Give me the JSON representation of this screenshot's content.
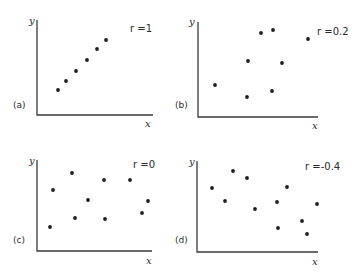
{
  "chart_data": [
    {
      "type": "scatter",
      "panel": "(a)",
      "annotation": "r = 1",
      "xlabel": "x",
      "ylabel": "y",
      "grid": false,
      "axis_box": {
        "x0": 37,
        "y0": 115,
        "x1": 153,
        "ytop": 20
      },
      "points": [
        [
          58,
          90
        ],
        [
          66,
          81
        ],
        [
          76,
          71
        ],
        [
          87,
          60
        ],
        [
          97,
          49
        ],
        [
          106,
          40
        ]
      ]
    },
    {
      "type": "scatter",
      "panel": "(b)",
      "annotation": "r = 0.2",
      "xlabel": "x",
      "ylabel": "y",
      "grid": false,
      "axis_box": {
        "x0": 198,
        "y0": 117,
        "x1": 318,
        "ytop": 22
      },
      "points": [
        [
          215,
          85
        ],
        [
          247,
          97
        ],
        [
          248,
          61
        ],
        [
          261,
          33
        ],
        [
          273,
          30
        ],
        [
          272,
          91
        ],
        [
          282,
          63
        ],
        [
          308,
          39
        ]
      ]
    },
    {
      "type": "scatter",
      "panel": "(c)",
      "annotation": "r = 0",
      "xlabel": "x",
      "ylabel": "y",
      "grid": false,
      "axis_box": {
        "x0": 37,
        "y0": 251,
        "x1": 152,
        "ytop": 160
      },
      "points": [
        [
          50,
          227
        ],
        [
          53,
          190
        ],
        [
          72,
          173
        ],
        [
          75,
          218
        ],
        [
          88,
          200
        ],
        [
          104,
          180
        ],
        [
          105,
          219
        ],
        [
          130,
          180
        ],
        [
          148,
          201
        ],
        [
          142,
          213
        ]
      ]
    },
    {
      "type": "scatter",
      "panel": "(d)",
      "annotation": "r = -0.4",
      "xlabel": "x",
      "ylabel": "y",
      "grid": false,
      "axis_box": {
        "x0": 197,
        "y0": 252,
        "x1": 318,
        "ytop": 161
      },
      "points": [
        [
          212,
          188
        ],
        [
          225,
          201
        ],
        [
          233,
          171
        ],
        [
          247,
          178
        ],
        [
          255,
          209
        ],
        [
          287,
          187
        ],
        [
          277,
          202
        ],
        [
          278,
          228
        ],
        [
          302,
          221
        ],
        [
          307,
          234
        ],
        [
          317,
          204
        ]
      ]
    }
  ],
  "panels": [
    {
      "label": "(a)",
      "r_text": "r =1",
      "x_axis": "x",
      "y_axis": "y"
    },
    {
      "label": "(b)",
      "r_text": "r =0.2",
      "x_axis": "x",
      "y_axis": "y"
    },
    {
      "label": "(c)",
      "r_text": "r =0",
      "x_axis": "x",
      "y_axis": "y"
    },
    {
      "label": "(d)",
      "r_text": "r =-0.4",
      "x_axis": "x",
      "y_axis": "y"
    }
  ]
}
